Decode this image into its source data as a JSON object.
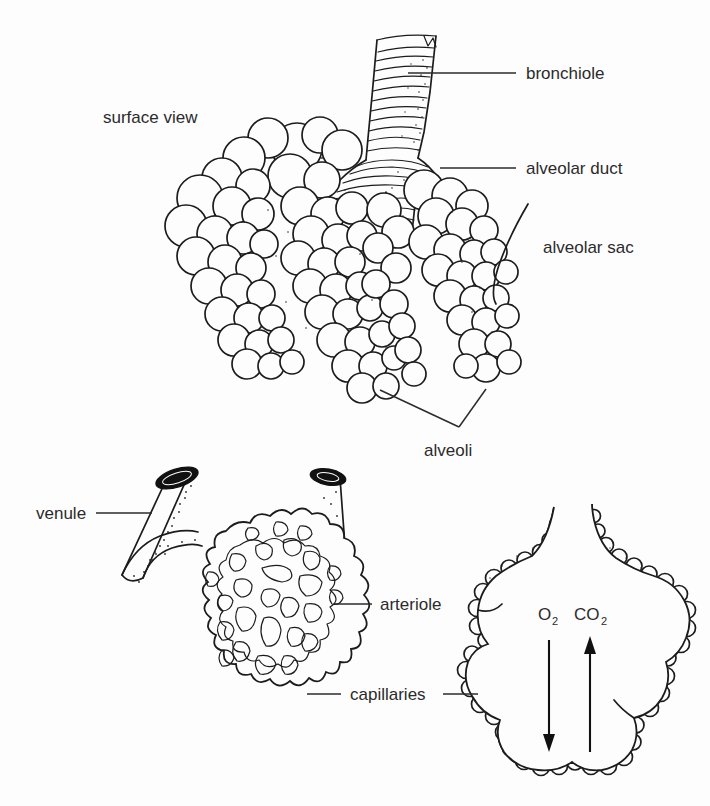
{
  "figure": {
    "domain": "anatomy-diagram",
    "background_color": "#fdfdfd",
    "ink_color": "#1c1c1c",
    "text_color": "#2b2b2b"
  },
  "panels": {
    "top": {
      "name": "surface-view-panel",
      "view_label": "surface view"
    },
    "bottom_left": {
      "name": "capillary-network-panel"
    },
    "bottom_right": {
      "name": "gas-exchange-panel"
    }
  },
  "labels": {
    "surface_view": "surface view",
    "bronchiole": "bronchiole",
    "alveolar_duct": "alveolar duct",
    "alveolar_sac": "alveolar sac",
    "alveoli": "alveoli",
    "venule": "venule",
    "arteriole": "arteriole",
    "capillaries": "capillaries",
    "oxygen": "O",
    "oxygen_sub": "2",
    "carbon_dioxide": "CO",
    "carbon_dioxide_sub": "2"
  },
  "gas_exchange": {
    "inflow": {
      "species": "O2",
      "direction": "down",
      "meaning": "oxygen into blood"
    },
    "outflow": {
      "species": "CO2",
      "direction": "up",
      "meaning": "carbon dioxide out of blood"
    }
  },
  "structures": [
    {
      "id": "bronchiole",
      "label": "bronchiole",
      "panel": "top",
      "description": "ringed airway tube entering from top"
    },
    {
      "id": "alveolar-duct",
      "label": "alveolar duct",
      "panel": "top",
      "description": "branch duct below bronchiole"
    },
    {
      "id": "alveolar-sac",
      "label": "alveolar sac",
      "panel": "top",
      "description": "terminal cluster of alveoli"
    },
    {
      "id": "alveoli",
      "label": "alveoli",
      "panel": "top",
      "description": "grape-like air sacs"
    },
    {
      "id": "venule",
      "label": "venule",
      "panel": "bottom_left",
      "description": "vessel draining the capillary bed"
    },
    {
      "id": "arteriole",
      "label": "arteriole",
      "panel": "bottom_left",
      "description": "vessel feeding the capillary bed"
    },
    {
      "id": "capillaries",
      "label": "capillaries",
      "panel": "bottom_left",
      "description": "mesh network over the alveolus"
    }
  ]
}
